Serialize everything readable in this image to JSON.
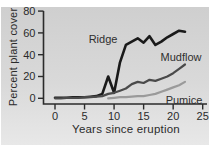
{
  "chart_data": {
    "type": "line",
    "title": "",
    "xlabel": "Years since eruption",
    "ylabel": "Percent plant cover",
    "xlim": [
      0,
      25
    ],
    "ylim": [
      0,
      80
    ],
    "xticks": [
      0,
      5,
      10,
      15,
      20,
      25
    ],
    "yticks": [
      0,
      20,
      40,
      60,
      80
    ],
    "grid": false,
    "legend": "inline-labels",
    "axis_color": "#2b2b2b",
    "tick_label_color": "#2b2b2b",
    "series": [
      {
        "name": "Ridge",
        "color": "#1a1a1a",
        "stroke_width": 2.6,
        "x": [
          0,
          1,
          2,
          3,
          4,
          5,
          6,
          7,
          8,
          9,
          10,
          11,
          12,
          13,
          14,
          15,
          16,
          17,
          18,
          19,
          20,
          21,
          22
        ],
        "values": [
          0.5,
          0.5,
          0.5,
          1,
          1,
          1,
          1.5,
          2,
          4,
          20,
          5,
          33,
          49,
          52,
          55,
          51,
          57,
          49,
          52,
          56,
          59,
          62,
          61
        ]
      },
      {
        "name": "Mudflow",
        "color": "#4a4a4a",
        "stroke_width": 2.2,
        "x": [
          0,
          1,
          2,
          3,
          4,
          5,
          6,
          7,
          8,
          9,
          10,
          11,
          12,
          13,
          14,
          15,
          16,
          17,
          18,
          19,
          20,
          21,
          22
        ],
        "values": [
          0,
          0,
          0.5,
          0.5,
          0.5,
          1,
          1,
          1.5,
          2,
          4,
          5,
          7,
          9,
          13,
          15,
          14,
          17,
          16,
          18,
          20,
          23,
          27,
          31
        ]
      },
      {
        "name": "Pumice",
        "color": "#9a9a9a",
        "stroke_width": 2.2,
        "x": [
          9,
          10,
          11,
          12,
          13,
          14,
          15,
          16,
          17,
          18,
          19,
          20,
          21,
          22
        ],
        "values": [
          0,
          0.5,
          1,
          1,
          1.5,
          2,
          2,
          3,
          4,
          6,
          8,
          10,
          12,
          15
        ]
      }
    ]
  }
}
